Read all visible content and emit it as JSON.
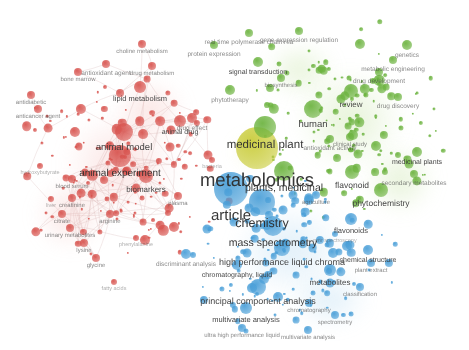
{
  "canvas": {
    "width": 469,
    "height": 350,
    "background": "#ffffff",
    "label_color": "#3a3a3a",
    "edge_color": "#d8b9b9"
  },
  "clusters": [
    {
      "id": "red",
      "name": "animal-experiment-cluster",
      "color": "#d8544f",
      "halo": "#f2b7b3"
    },
    {
      "id": "green",
      "name": "medicinal-plant-cluster",
      "color": "#6cb33f",
      "halo": "#bfe09a"
    },
    {
      "id": "blue",
      "name": "mass-spectrometry-cluster",
      "color": "#4a9fd8",
      "halo": "#aed6ef"
    },
    {
      "id": "yellow",
      "name": "metabolomics-core",
      "color": "#c9cc3a",
      "halo": "#e3e57f"
    }
  ],
  "chart_data": {
    "type": "scatter",
    "title": "",
    "xlabel": "",
    "ylabel": "",
    "nodes": [
      {
        "label": "metabolomics",
        "x": 257,
        "y": 148,
        "r": 21,
        "cluster": "yellow",
        "size": 18.5
      },
      {
        "label": "article",
        "x": 231,
        "y": 189,
        "r": 17,
        "cluster": "blue",
        "size": 15
      },
      {
        "label": "chemistry",
        "x": 262,
        "y": 202,
        "r": 13,
        "cluster": "blue",
        "size": 12.5
      },
      {
        "label": "medicinal plant",
        "x": 265,
        "y": 127,
        "r": 11,
        "cluster": "green",
        "size": 11.5
      },
      {
        "label": "plants, medicinal",
        "x": 284,
        "y": 171,
        "r": 10,
        "cluster": "green",
        "size": 10.5
      },
      {
        "label": "mass spectrometry",
        "x": 273,
        "y": 226,
        "r": 10,
        "cluster": "blue",
        "size": 10.5
      },
      {
        "label": "animal experiment",
        "x": 120,
        "y": 156,
        "r": 11,
        "cluster": "red",
        "size": 10
      },
      {
        "label": "animal model",
        "x": 124,
        "y": 132,
        "r": 9,
        "cluster": "red",
        "size": 9.5
      },
      {
        "label": "human",
        "x": 313,
        "y": 109,
        "r": 9,
        "cluster": "green",
        "size": 9.5
      },
      {
        "label": "high performance liquid chroma",
        "x": 282,
        "y": 248,
        "r": 8,
        "cluster": "blue",
        "size": 9
      },
      {
        "label": "principal component analysis",
        "x": 258,
        "y": 287,
        "r": 8,
        "cluster": "blue",
        "size": 9
      },
      {
        "label": "phytochemistry",
        "x": 381,
        "y": 190,
        "r": 7,
        "cluster": "green",
        "size": 8.5
      },
      {
        "label": "flavonoid",
        "x": 352,
        "y": 172,
        "r": 7,
        "cluster": "green",
        "size": 8.5
      },
      {
        "label": "biomarkers",
        "x": 146,
        "y": 176,
        "r": 7,
        "cluster": "red",
        "size": 8
      },
      {
        "label": "metabolites",
        "x": 330,
        "y": 270,
        "r": 6,
        "cluster": "blue",
        "size": 8
      },
      {
        "label": "review",
        "x": 351,
        "y": 91,
        "r": 7,
        "cluster": "green",
        "size": 8
      },
      {
        "label": "multivariate analysis",
        "x": 246,
        "y": 308,
        "r": 6,
        "cluster": "blue",
        "size": 7.5
      },
      {
        "label": "flavonoids",
        "x": 351,
        "y": 219,
        "r": 6,
        "cluster": "blue",
        "size": 7.5
      },
      {
        "label": "lipid metabolism",
        "x": 140,
        "y": 87,
        "r": 6,
        "cluster": "red",
        "size": 7.5
      },
      {
        "label": "animal drug",
        "x": 180,
        "y": 121,
        "r": 6,
        "cluster": "red",
        "size": 7
      },
      {
        "label": "medicinal plants",
        "x": 417,
        "y": 152,
        "r": 5,
        "cluster": "green",
        "size": 7
      },
      {
        "label": "signal transduction",
        "x": 258,
        "y": 62,
        "r": 5,
        "cluster": "green",
        "size": 7
      },
      {
        "label": "chemical structure",
        "x": 368,
        "y": 250,
        "r": 5,
        "cluster": "blue",
        "size": 7
      },
      {
        "label": "chromatography, liquid",
        "x": 237,
        "y": 265,
        "r": 5,
        "cluster": "blue",
        "size": 7
      },
      {
        "label": "gene expression regulation",
        "x": 299,
        "y": 31,
        "r": 4,
        "cluster": "green",
        "size": 6.5
      },
      {
        "label": "protein expression",
        "x": 214,
        "y": 45,
        "r": 4,
        "cluster": "green",
        "size": 6.5
      },
      {
        "label": "real time polymerase chain rea",
        "x": 249,
        "y": 33,
        "r": 4,
        "cluster": "green",
        "size": 6.5
      },
      {
        "label": "genetics",
        "x": 407,
        "y": 45,
        "r": 5,
        "cluster": "green",
        "size": 6.5
      },
      {
        "label": "drug development",
        "x": 379,
        "y": 72,
        "r": 4,
        "cluster": "green",
        "size": 6.5
      },
      {
        "label": "drug discovery",
        "x": 398,
        "y": 97,
        "r": 4,
        "cluster": "green",
        "size": 6.5
      },
      {
        "label": "metabolic engineering",
        "x": 393,
        "y": 60,
        "r": 4,
        "cluster": "green",
        "size": 6.5
      },
      {
        "label": "secondary metabolites",
        "x": 414,
        "y": 174,
        "r": 4,
        "cluster": "green",
        "size": 6.5
      },
      {
        "label": "antioxidant activity",
        "x": 330,
        "y": 139,
        "r": 4,
        "cluster": "green",
        "size": 6.5
      },
      {
        "label": "clinical study",
        "x": 350,
        "y": 137,
        "r": 4,
        "cluster": "green",
        "size": 6
      },
      {
        "label": "phytotherapy",
        "x": 230,
        "y": 90,
        "r": 5,
        "cluster": "green",
        "size": 6.5
      },
      {
        "label": "drug effect",
        "x": 192,
        "y": 118,
        "r": 5,
        "cluster": "red",
        "size": 6.5
      },
      {
        "label": "antioxidant agent",
        "x": 106,
        "y": 64,
        "r": 4,
        "cluster": "red",
        "size": 6.5
      },
      {
        "label": "bone marrow",
        "x": 78,
        "y": 72,
        "r": 4,
        "cluster": "red",
        "size": 6
      },
      {
        "label": "antidiabetic",
        "x": 31,
        "y": 95,
        "r": 4,
        "cluster": "red",
        "size": 6
      },
      {
        "label": "anticancer agent",
        "x": 38,
        "y": 109,
        "r": 4,
        "cluster": "red",
        "size": 6
      },
      {
        "label": "drug metabolism",
        "x": 152,
        "y": 66,
        "r": 4,
        "cluster": "red",
        "size": 6
      },
      {
        "label": "choline metabolism",
        "x": 142,
        "y": 44,
        "r": 4,
        "cluster": "red",
        "size": 6
      },
      {
        "label": "discriminant analysis",
        "x": 186,
        "y": 254,
        "r": 5,
        "cluster": "blue",
        "size": 6.5
      },
      {
        "label": "ultra high performance liquid",
        "x": 242,
        "y": 328,
        "r": 4,
        "cluster": "blue",
        "size": 6
      },
      {
        "label": "multivariate analysis",
        "x": 308,
        "y": 330,
        "r": 4,
        "cluster": "blue",
        "size": 6
      },
      {
        "label": "classification",
        "x": 360,
        "y": 287,
        "r": 4,
        "cluster": "blue",
        "size": 6
      },
      {
        "label": "chromatography",
        "x": 309,
        "y": 303,
        "r": 4,
        "cluster": "blue",
        "size": 6
      },
      {
        "label": "spectrometry",
        "x": 335,
        "y": 315,
        "r": 4,
        "cluster": "blue",
        "size": 6
      },
      {
        "label": "plant extract",
        "x": 371,
        "y": 263,
        "r": 4,
        "cluster": "blue",
        "size": 6
      },
      {
        "label": "creatinine",
        "x": 72,
        "y": 198,
        "r": 4,
        "cluster": "red",
        "size": 6
      },
      {
        "label": "citrate",
        "x": 62,
        "y": 214,
        "r": 4,
        "cluster": "red",
        "size": 6
      },
      {
        "label": "arginine",
        "x": 110,
        "y": 214,
        "r": 4,
        "cluster": "red",
        "size": 6
      },
      {
        "label": "lysine",
        "x": 84,
        "y": 243,
        "r": 4,
        "cluster": "red",
        "size": 6
      },
      {
        "label": "glycine",
        "x": 96,
        "y": 258,
        "r": 4,
        "cluster": "red",
        "size": 6
      },
      {
        "label": "blood serum",
        "x": 72,
        "y": 179,
        "r": 4,
        "cluster": "red",
        "size": 6
      },
      {
        "label": "urinary metabolites",
        "x": 70,
        "y": 228,
        "r": 4,
        "cluster": "red",
        "size": 6
      },
      {
        "label": "hydroxybutyrate",
        "x": 40,
        "y": 166,
        "r": 3,
        "cluster": "red",
        "size": 5.5
      },
      {
        "label": "liver",
        "x": 51,
        "y": 199,
        "r": 3,
        "cluster": "red",
        "size": 5.5
      },
      {
        "label": "fatty acids",
        "x": 114,
        "y": 282,
        "r": 3,
        "cluster": "red",
        "size": 5.5
      },
      {
        "label": "phenylalanine",
        "x": 136,
        "y": 238,
        "r": 3,
        "cluster": "red",
        "size": 5.5
      },
      {
        "label": "plasma",
        "x": 178,
        "y": 196,
        "r": 4,
        "cluster": "red",
        "size": 6
      },
      {
        "label": "bacteria",
        "x": 212,
        "y": 160,
        "r": 3,
        "cluster": "red",
        "size": 5.5
      },
      {
        "label": "agriculture",
        "x": 316,
        "y": 195,
        "r": 4,
        "cluster": "blue",
        "size": 6
      },
      {
        "label": "nmr spectroscopy",
        "x": 335,
        "y": 234,
        "r": 3,
        "cluster": "blue",
        "size": 5.5
      },
      {
        "label": "biosynthesis",
        "x": 281,
        "y": 78,
        "r": 4,
        "cluster": "green",
        "size": 6
      }
    ]
  }
}
